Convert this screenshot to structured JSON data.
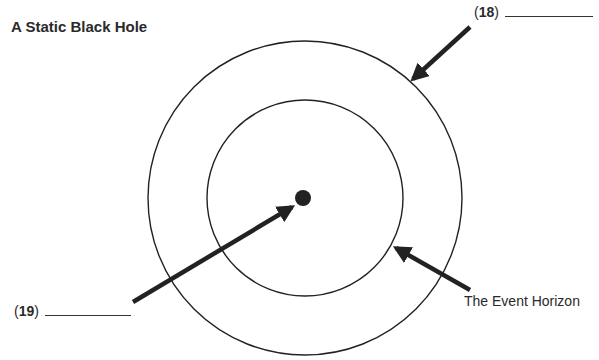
{
  "diagram": {
    "title": "A Static Black Hole",
    "labels": {
      "q18": {
        "open": "(",
        "number": "18",
        "close": ")",
        "answer": ""
      },
      "q19": {
        "open": "(",
        "number": "19",
        "close": ")",
        "answer": ""
      },
      "event_horizon": "The Event Horizon"
    },
    "shapes": {
      "outer_circle": {
        "cx": 305,
        "cy": 198,
        "r": 157
      },
      "inner_circle": {
        "cx": 305,
        "cy": 198,
        "r": 98
      },
      "singularity_dot": {
        "cx": 303,
        "cy": 198,
        "r": 8
      }
    },
    "colors": {
      "ink": "#222222",
      "background": "#ffffff"
    }
  }
}
